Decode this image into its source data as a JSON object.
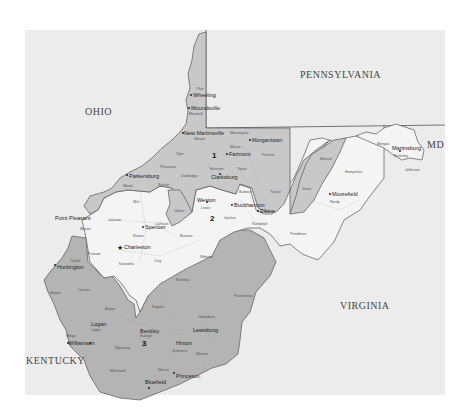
{
  "map": {
    "title": "West Virginia Congressional Districts",
    "colors": {
      "background": "#ececec",
      "district_1": "#c8c8c8",
      "district_2": "#f4f4f4",
      "district_3": "#b4b4b4",
      "border": "#555555"
    },
    "states": {
      "ohio": "OHIO",
      "pennsylvania": "PENNSYLVANIA",
      "maryland": "MD",
      "virginia": "VIRGINIA",
      "kentucky": "KENTUCKY"
    },
    "districts": {
      "d1": "1",
      "d2": "2",
      "d3": "3"
    },
    "cities": {
      "wheeling": "Wheeling",
      "moundsville": "Moundsville",
      "new_martinsville": "New Martinsville",
      "morgantown": "Morgantown",
      "fairmont": "Fairmont",
      "clarksburg": "Clarksburg",
      "parkersburg": "Parkersburg",
      "weston": "Weston",
      "buckhannon": "Buckhannon",
      "elkins": "Elkins",
      "spencer": "Spencer",
      "charleston": "Charleston",
      "huntington": "Huntington",
      "logan": "Logan",
      "williamson": "Williamson",
      "beckley": "Beckley",
      "lewisburg": "Lewisburg",
      "hinton": "Hinton",
      "princeton": "Princeton",
      "bluefield": "Bluefield",
      "moorefield": "Moorefield",
      "martinsburg": "Martinsburg",
      "point_pleasant": "Point Pleasant"
    },
    "counties": {
      "ohio": "Ohio",
      "marshall": "Marshall",
      "brooke": "Brooke",
      "hancock": "Hancock",
      "wetzel": "Wetzel",
      "tyler": "Tyler",
      "monongalia": "Monongalia",
      "marion": "Marion",
      "preston": "Preston",
      "doddridge": "Doddridge",
      "harrison": "Harrison",
      "taylor": "Taylor",
      "barbour": "Barbour",
      "tucker": "Tucker",
      "grant": "Grant",
      "mineral": "Mineral",
      "wood": "Wood",
      "ritchie": "Ritchie",
      "pleasants": "Pleasants",
      "gilmer": "Gilmer",
      "wirt": "Wirt",
      "lewis": "Lewis",
      "upshur": "Upshur",
      "randolph": "Randolph",
      "pendleton": "Pendleton",
      "hardy": "Hardy",
      "hampshire": "Hampshire",
      "morgan": "Morgan",
      "berkeley": "Berkeley",
      "jefferson": "Jefferson",
      "jackson": "Jackson",
      "mason": "Mason",
      "roane": "Roane",
      "calhoun": "Calhoun",
      "braxton": "Braxton",
      "putnam": "Putnam",
      "kanawha": "Kanawha",
      "clay": "Clay",
      "cabell": "Cabell",
      "wayne": "Wayne",
      "lincoln": "Lincoln",
      "boone": "Boone",
      "logan": "Logan",
      "mingo": "Mingo",
      "wyoming": "Wyoming",
      "mcdowell": "McDowell",
      "raleigh": "Raleigh",
      "mercer": "Mercer",
      "summers": "Summers",
      "monroe": "Monroe",
      "fayette": "Fayette",
      "nicholas": "Nicholas",
      "webster": "Webster",
      "greenbrier": "Greenbrier",
      "pocahontas": "Pocahontas"
    }
  }
}
